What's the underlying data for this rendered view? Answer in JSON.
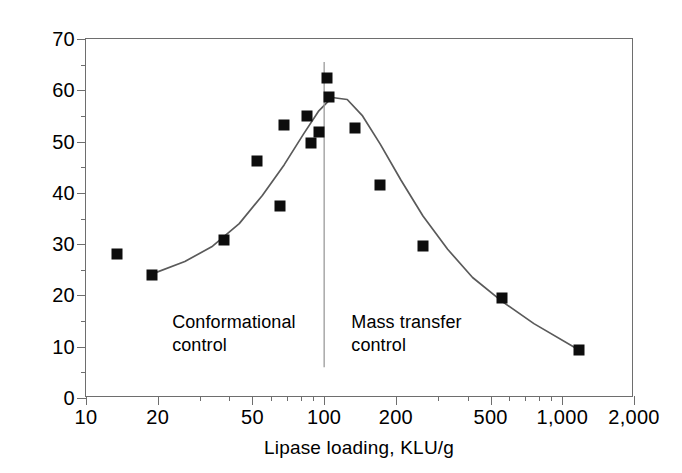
{
  "chart_data": {
    "type": "scatter",
    "title": "",
    "xlabel": "Lipase loading, KLU/g",
    "ylabel": "Esterification efficiency, µmol/m/KLU",
    "xscale": "log",
    "yscale": "linear",
    "xlim": [
      10,
      2000
    ],
    "ylim": [
      0,
      70
    ],
    "grid": false,
    "legend": null,
    "x_ticks": [
      10,
      20,
      50,
      100,
      200,
      500,
      1000,
      2000
    ],
    "x_tick_labels": [
      "10",
      "20",
      "50",
      "100",
      "200",
      "500",
      "1,000",
      "2,000"
    ],
    "y_ticks": [
      0,
      10,
      20,
      30,
      40,
      50,
      60,
      70
    ],
    "y_tick_labels": [
      "0",
      "10",
      "20",
      "30",
      "40",
      "50",
      "60",
      "70"
    ],
    "y_minor_ticks": [
      5,
      15,
      25,
      35,
      45,
      55,
      65
    ],
    "series": [
      {
        "name": "Esterification efficiency",
        "marker": "filled-square",
        "color": "#0d0d0d",
        "points": [
          {
            "x": 13.5,
            "y": 28.0
          },
          {
            "x": 19.0,
            "y": 24.0
          },
          {
            "x": 38.0,
            "y": 30.8
          },
          {
            "x": 52.0,
            "y": 46.3
          },
          {
            "x": 65.0,
            "y": 37.5
          },
          {
            "x": 68.0,
            "y": 53.3
          },
          {
            "x": 85.0,
            "y": 55.0
          },
          {
            "x": 88.0,
            "y": 49.7
          },
          {
            "x": 95.0,
            "y": 51.9
          },
          {
            "x": 103.0,
            "y": 62.3
          },
          {
            "x": 105.0,
            "y": 58.7
          },
          {
            "x": 135.0,
            "y": 52.6
          },
          {
            "x": 172.0,
            "y": 41.5
          },
          {
            "x": 260.0,
            "y": 29.6
          },
          {
            "x": 560.0,
            "y": 19.5
          },
          {
            "x": 1180.0,
            "y": 9.3
          }
        ]
      }
    ],
    "fit_curve": {
      "name": "trend line",
      "color": "#5a5a5a",
      "points": [
        {
          "x": 19.0,
          "y": 24.2
        },
        {
          "x": 26.0,
          "y": 26.6
        },
        {
          "x": 34.0,
          "y": 29.6
        },
        {
          "x": 44.0,
          "y": 34.0
        },
        {
          "x": 55.0,
          "y": 39.5
        },
        {
          "x": 68.0,
          "y": 45.5
        },
        {
          "x": 82.0,
          "y": 51.5
        },
        {
          "x": 95.0,
          "y": 56.0
        },
        {
          "x": 108.0,
          "y": 58.6
        },
        {
          "x": 125.0,
          "y": 58.2
        },
        {
          "x": 145.0,
          "y": 55.0
        },
        {
          "x": 172.0,
          "y": 49.5
        },
        {
          "x": 210.0,
          "y": 42.5
        },
        {
          "x": 260.0,
          "y": 35.5
        },
        {
          "x": 330.0,
          "y": 29.0
        },
        {
          "x": 420.0,
          "y": 23.5
        },
        {
          "x": 560.0,
          "y": 18.8
        },
        {
          "x": 760.0,
          "y": 14.5
        },
        {
          "x": 1180.0,
          "y": 9.3
        }
      ]
    },
    "divider": {
      "x": 100.0,
      "y_top": 65.5,
      "y_bottom": 6.0,
      "color": "#9a9a9a"
    },
    "annotations": [
      {
        "name": "conformational-control",
        "text": "Conformational\ncontrol",
        "x": 23.0,
        "y": 17.0
      },
      {
        "name": "mass-transfer-control",
        "text": "Mass transfer\ncontrol",
        "x": 130.0,
        "y": 17.0
      }
    ]
  }
}
